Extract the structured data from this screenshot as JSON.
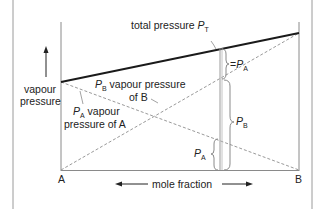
{
  "diagram": {
    "title": "",
    "type": "Raoult's law ideal mixture vapour pressure diagram",
    "colors": {
      "frame": "#9a9a9a",
      "axis": "#8a8a8a",
      "total_line": "#1a1a1a",
      "dashed": "#9a9a9a",
      "text": "#222222"
    },
    "labels": {
      "total_pressure": "total pressure ",
      "total_pressure_symbol": "P",
      "total_pressure_sub": "T",
      "pb_symbol": "P",
      "pb_sub": "B",
      "pb_text_line1": " vapour pressure",
      "pb_text_line2": "of B",
      "pa_symbol": "P",
      "pa_sub": "A",
      "pa_text_line1": " vapour",
      "pa_text_line2": "pressure of A",
      "y_axis_line1": "vapour",
      "y_axis_line2": "pressure",
      "x_axis": "mole fraction",
      "corner_left": "A",
      "corner_right": "B",
      "brace_top_eq": "=",
      "brace_top_symbol": "P",
      "brace_top_sub": "A",
      "brace_mid_symbol": "P",
      "brace_mid_sub": "B",
      "brace_low_symbol": "P",
      "brace_low_sub": "A"
    },
    "lines": {
      "total_pressure": {
        "from": [
          61,
          82
        ],
        "to": [
          299,
          33
        ]
      },
      "vapour_pressure_A": {
        "from": [
          61,
          82
        ],
        "to": [
          299,
          170
        ]
      },
      "vapour_pressure_B": {
        "from": [
          61,
          170
        ],
        "to": [
          299,
          33
        ]
      }
    }
  }
}
